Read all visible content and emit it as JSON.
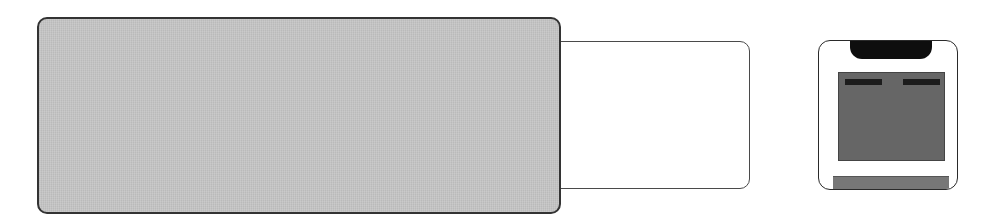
{
  "diagram": {
    "left_panel": {
      "fill": "#c4c4c4",
      "border": "#333333"
    },
    "right_panel": {
      "fill": "#ffffff",
      "border": "#4a4a4a"
    },
    "device_icon": {
      "body_fill": "#ffffff",
      "top_pill": "#0e0e0e",
      "screen_fill": "#666666",
      "indicator_bars": 2,
      "base_fill": "#777777"
    }
  }
}
